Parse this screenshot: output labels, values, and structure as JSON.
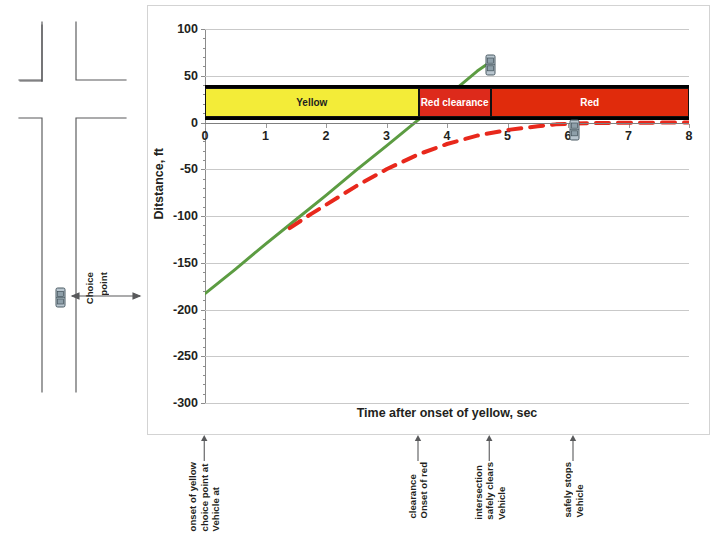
{
  "figure": {
    "y_axis_title": "Ditstance, ft",
    "x_axis_title": "Time after onset of yellow, sec"
  },
  "road_diagram": {
    "choice_point_label_line1": "Choice",
    "choice_point_label_line2": "point",
    "car_icon": "car-icon",
    "left_arrow_icon": "arrow-left-icon",
    "right_arrow_icon": "arrow-right-icon"
  },
  "signal_bar": {
    "segments": [
      {
        "label": "Yellow",
        "color": "#f3ec38",
        "text_color": "#231f20",
        "t_start": 0,
        "t_end": 3.53
      },
      {
        "label": "Red clearance",
        "color": "#dd2a1b",
        "text_color": "#ffffff",
        "t_start": 3.53,
        "t_end": 4.72
      },
      {
        "label": "Red",
        "color": "#e02b0c",
        "text_color": "#ffffff",
        "t_start": 4.72,
        "t_end": 8.0
      }
    ]
  },
  "annotations": [
    {
      "name": "vehicle-at-choice-point",
      "t": 0.0,
      "lines": [
        "Vehicle at",
        "choice point at",
        "onset of yellow"
      ]
    },
    {
      "name": "onset-of-red-clearance",
      "t": 3.53,
      "lines": [
        "Onset of red",
        "clearance"
      ]
    },
    {
      "name": "vehicle-safely-clears",
      "t": 4.72,
      "lines": [
        "Vehicle",
        "safely clears",
        "intersection"
      ]
    },
    {
      "name": "vehicle-safely-stops",
      "t": 6.1,
      "lines": [
        "Vehicle",
        "safely stops"
      ]
    }
  ],
  "chart_data": {
    "type": "line",
    "title": "",
    "xlabel": "Time after onset of yellow, sec",
    "ylabel": "Ditstance, ft",
    "xlim": [
      0,
      8
    ],
    "ylim": [
      -300,
      100
    ],
    "xticks": [
      0,
      1,
      2,
      3,
      4,
      5,
      6,
      7,
      8
    ],
    "yticks": [
      -300,
      -250,
      -200,
      -150,
      -100,
      -50,
      0,
      50,
      100
    ],
    "grid": true,
    "legend": "none",
    "series": [
      {
        "name": "Go trajectory (constant speed)",
        "style": "solid",
        "color": "#5c9c42",
        "width": 3,
        "x": [
          0.0,
          0.5,
          1.0,
          1.5,
          2.0,
          2.5,
          3.0,
          3.53,
          4.0,
          4.5,
          4.68
        ],
        "y": [
          -183,
          -157,
          -130,
          -104,
          -78,
          -51,
          -25,
          3,
          28,
          55,
          63
        ]
      },
      {
        "name": "Stop trajectory (braking)",
        "style": "dashed",
        "color": "#e8281c",
        "width": 4,
        "x": [
          1.4,
          1.75,
          2.0,
          2.5,
          3.0,
          3.53,
          4.0,
          4.5,
          5.0,
          5.5,
          5.8,
          6.1,
          6.6,
          7.2,
          8.0
        ],
        "y": [
          -113,
          -98,
          -88,
          -68,
          -50,
          -34,
          -23,
          -14,
          -8,
          -4,
          -2,
          -1,
          -0.5,
          -0.2,
          0
        ]
      }
    ],
    "markers": [
      {
        "name": "car-clears-intersection",
        "x": 4.72,
        "y": 62,
        "icon": "car-icon"
      },
      {
        "name": "car-stopped",
        "x": 6.1,
        "y": -8,
        "icon": "car-icon"
      }
    ],
    "bands": [
      {
        "label": "Yellow",
        "x_start": 0.0,
        "x_end": 3.53,
        "y_start": 3,
        "y_end": 40,
        "color": "#f3ec38"
      },
      {
        "label": "Red clearance",
        "x_start": 3.53,
        "x_end": 4.72,
        "y_start": 3,
        "y_end": 40,
        "color": "#dd2a1b"
      },
      {
        "label": "Red",
        "x_start": 4.72,
        "x_end": 8.0,
        "y_start": 3,
        "y_end": 40,
        "color": "#e02b0c"
      }
    ]
  }
}
